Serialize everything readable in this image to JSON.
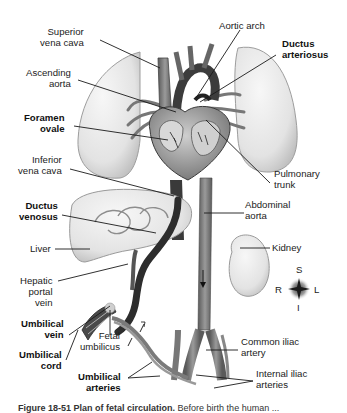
{
  "diagram": {
    "title": "Plan of fetal circulation",
    "colors": {
      "background": "#ffffff",
      "label_text": "#222222",
      "leader_line": "#1a1a1a",
      "organ_fill": "#e6e6e6",
      "vessel_dark": "#4a4a4a",
      "vessel_mid": "#8a8a8a"
    },
    "labels": {
      "superior_vena_cava": [
        "Superior",
        "vena cava"
      ],
      "ascending_aorta": [
        "Ascending",
        "aorta"
      ],
      "foramen_ovale": [
        "Foramen",
        "ovale"
      ],
      "inferior_vena_cava": [
        "Inferior",
        "vena cava"
      ],
      "ductus_venosus": [
        "Ductus",
        "venosus"
      ],
      "liver": "Liver",
      "hepatic_portal_vein": [
        "Hepatic",
        "portal",
        "vein"
      ],
      "umbilical_vein": [
        "Umbilical",
        "vein"
      ],
      "umbilical_cord": [
        "Umbilical",
        "cord"
      ],
      "fetal_umbilicus": [
        "Fetal",
        "umbilicus"
      ],
      "umbilical_arteries": [
        "Umbilical",
        "arteries"
      ],
      "aortic_arch": "Aortic arch",
      "ductus_arteriosus": [
        "Ductus",
        "arteriosus"
      ],
      "pulmonary_trunk": [
        "Pulmonary",
        "trunk"
      ],
      "abdominal_aorta": [
        "Abdominal",
        "aorta"
      ],
      "kidney": "Kidney",
      "common_iliac_artery": [
        "Common iliac",
        "artery"
      ],
      "internal_iliac_arteries": [
        "Internal iliac",
        "arteries"
      ]
    },
    "bold_labels": [
      "foramen_ovale",
      "ductus_venosus",
      "umbilical_vein",
      "umbilical_cord",
      "umbilical_arteries",
      "ductus_arteriosus"
    ],
    "compass": {
      "superior": "S",
      "inferior": "I",
      "right": "R",
      "left": "L"
    },
    "caption": {
      "figure_number": "Figure 18-51",
      "figure_title": "Plan of fetal circulation.",
      "text": "Before birth the human ...",
      "clipped": true
    }
  }
}
